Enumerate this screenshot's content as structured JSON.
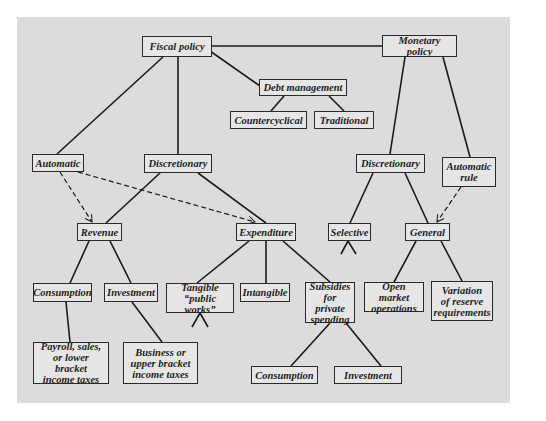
{
  "diagram": {
    "colors": {
      "panel": "#dcdcdc",
      "box_fill": "#e6e6e6",
      "line": "#1a1a1a"
    },
    "nodes": {
      "fiscal_policy": "Fiscal policy",
      "monetary_policy": "Monetary policy",
      "debt_management": "Debt management",
      "countercyclical": "Countercyclical",
      "traditional": "Traditional",
      "fiscal_automatic": "Automatic",
      "fiscal_discretionary": "Discretionary",
      "monetary_discretionary": "Discretionary",
      "automatic_rule": "Automatic\nrule",
      "revenue": "Revenue",
      "expenditure": "Expenditure",
      "selective": "Selective",
      "general": "General",
      "revenue_consumption": "Consumption",
      "revenue_investment": "Investment",
      "tangible": "Tangible\n“public works”",
      "intangible": "Intangible",
      "subsidies": "Subsidies\nfor private\nspending",
      "open_market": "Open market\noperations",
      "reserve_requirements": "Variation\nof reserve\nrequirements",
      "lower_bracket_taxes": "Payroll, sales,\nor lower bracket\nincome taxes",
      "upper_bracket_taxes": "Business or\nupper bracket\nincome  taxes",
      "subsidy_consumption": "Consumption",
      "subsidy_investment": "Investment"
    },
    "edges": [
      {
        "from": "fiscal_policy",
        "to": "monetary_policy",
        "style": "solid"
      },
      {
        "from": "fiscal_policy",
        "to": "debt_management",
        "style": "solid"
      },
      {
        "from": "fiscal_policy",
        "to": "fiscal_automatic",
        "style": "solid"
      },
      {
        "from": "fiscal_policy",
        "to": "fiscal_discretionary",
        "style": "solid"
      },
      {
        "from": "debt_management",
        "to": "countercyclical",
        "style": "solid"
      },
      {
        "from": "debt_management",
        "to": "traditional",
        "style": "solid"
      },
      {
        "from": "monetary_policy",
        "to": "monetary_discretionary",
        "style": "solid"
      },
      {
        "from": "monetary_policy",
        "to": "automatic_rule",
        "style": "solid"
      },
      {
        "from": "fiscal_automatic",
        "to": "revenue",
        "style": "dashed-arrow"
      },
      {
        "from": "fiscal_automatic",
        "to": "expenditure",
        "style": "dashed-arrow"
      },
      {
        "from": "fiscal_discretionary",
        "to": "revenue",
        "style": "solid"
      },
      {
        "from": "fiscal_discretionary",
        "to": "expenditure",
        "style": "solid"
      },
      {
        "from": "monetary_discretionary",
        "to": "selective",
        "style": "solid"
      },
      {
        "from": "monetary_discretionary",
        "to": "general",
        "style": "solid"
      },
      {
        "from": "automatic_rule",
        "to": "general",
        "style": "dashed-arrow"
      },
      {
        "from": "revenue",
        "to": "revenue_consumption",
        "style": "solid"
      },
      {
        "from": "revenue",
        "to": "revenue_investment",
        "style": "solid"
      },
      {
        "from": "expenditure",
        "to": "tangible",
        "style": "solid"
      },
      {
        "from": "expenditure",
        "to": "intangible",
        "style": "solid"
      },
      {
        "from": "expenditure",
        "to": "subsidies",
        "style": "solid"
      },
      {
        "from": "general",
        "to": "open_market",
        "style": "solid"
      },
      {
        "from": "general",
        "to": "reserve_requirements",
        "style": "solid"
      },
      {
        "from": "revenue_consumption",
        "to": "lower_bracket_taxes",
        "style": "solid"
      },
      {
        "from": "revenue_investment",
        "to": "upper_bracket_taxes",
        "style": "solid"
      },
      {
        "from": "subsidies",
        "to": "subsidy_consumption",
        "style": "solid"
      },
      {
        "from": "subsidies",
        "to": "subsidy_investment",
        "style": "solid"
      },
      {
        "from": "selective",
        "to": "(further branches)",
        "style": "stub"
      },
      {
        "from": "tangible",
        "to": "(further branches)",
        "style": "stub"
      }
    ]
  }
}
